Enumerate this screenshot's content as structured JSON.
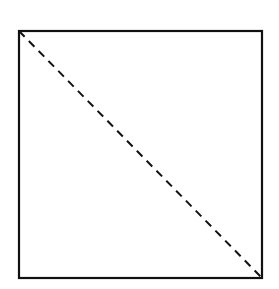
{
  "diagram": {
    "background": "#ffffff",
    "stroke_color": "#111111",
    "square": {
      "x": 19,
      "y": 31,
      "width": 243,
      "height": 247,
      "stroke_width": 2.2
    },
    "diagonal": {
      "x1": 19,
      "y1": 31,
      "x2": 262,
      "y2": 278,
      "stroke_width": 2,
      "dash": "8,6"
    }
  }
}
